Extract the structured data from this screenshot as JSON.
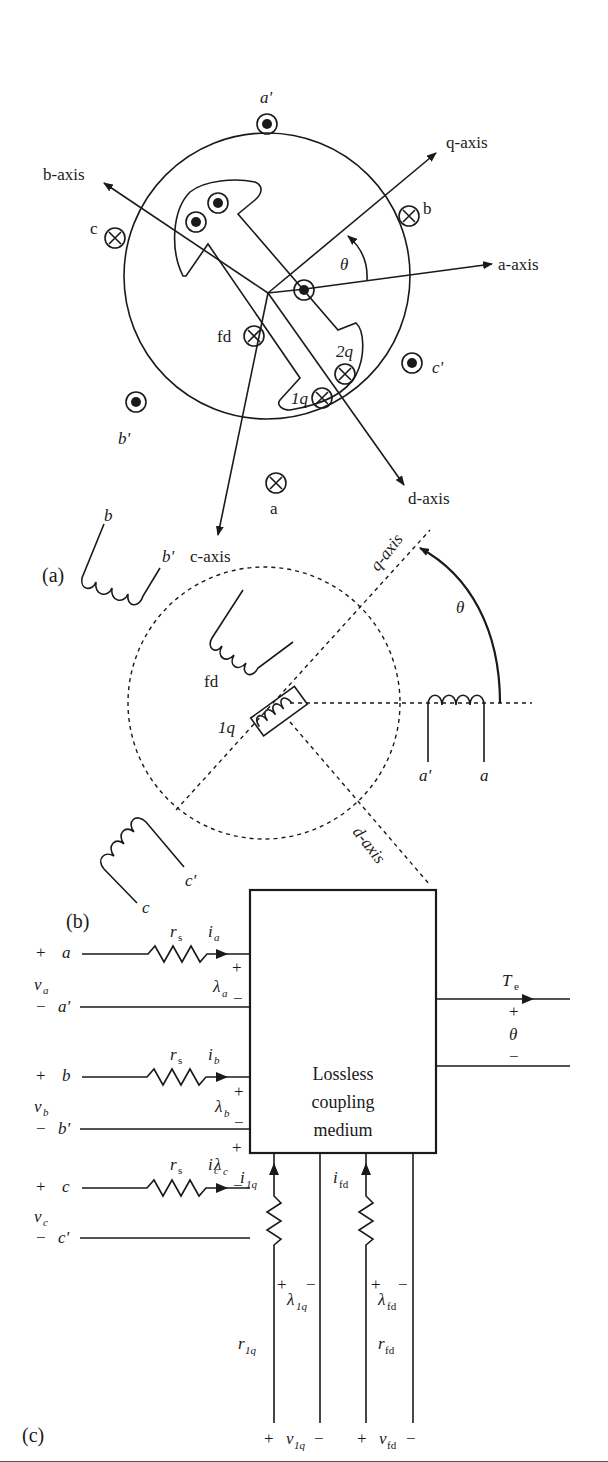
{
  "figure": {
    "panels": [
      {
        "id": "a",
        "caption": "(a)",
        "title": "Cross-section of synchronous machine with stator and rotor windings",
        "axes": [
          "a-axis",
          "b-axis",
          "c-axis",
          "d-axis",
          "q-axis"
        ],
        "stator_conductors": [
          {
            "label": "a'",
            "symbol": "dot"
          },
          {
            "label": "b",
            "symbol": "cross"
          },
          {
            "label": "c'",
            "symbol": "dot"
          },
          {
            "label": "a",
            "symbol": "cross"
          },
          {
            "label": "b'",
            "symbol": "dot"
          },
          {
            "label": "c",
            "symbol": "cross"
          }
        ],
        "rotor_conductors": [
          {
            "label": "fd",
            "symbol": "cross"
          },
          {
            "label": "2q",
            "symbol": "cross"
          },
          {
            "label": "1q",
            "symbol": "cross"
          }
        ],
        "angle_label": "θ"
      },
      {
        "id": "b",
        "caption": "(b)",
        "title": "Winding schematic",
        "axis_labels": [
          "q-axis",
          "d-axis"
        ],
        "windings": [
          {
            "label_start": "a'",
            "label_end": "a"
          },
          {
            "label_start": "b",
            "label_end": "b'"
          },
          {
            "label_start": "c'",
            "label_end": "c"
          },
          {
            "label": "fd"
          },
          {
            "label": "1q"
          }
        ],
        "angle_label": "θ"
      },
      {
        "id": "c",
        "caption": "(c)",
        "title": "Lossless coupling medium model",
        "box_label_lines": [
          "Lossless",
          "coupling",
          "medium"
        ],
        "stator_ports": [
          {
            "terminal": "a",
            "terminal_prime": "a'",
            "resistor": "r",
            "resistor_sub": "s",
            "current": "i",
            "current_sub": "a",
            "voltage": "v",
            "voltage_sub": "a",
            "flux": "λ",
            "flux_sub": "a"
          },
          {
            "terminal": "b",
            "terminal_prime": "b'",
            "resistor": "r",
            "resistor_sub": "s",
            "current": "i",
            "current_sub": "b",
            "voltage": "v",
            "voltage_sub": "b",
            "flux": "λ",
            "flux_sub": "b"
          },
          {
            "terminal": "c",
            "terminal_prime": "c'",
            "resistor": "r",
            "resistor_sub": "s",
            "current": "i",
            "current_sub": "c",
            "voltage": "v",
            "voltage_sub": "c",
            "flux": "λ",
            "flux_sub": "c"
          }
        ],
        "rotor_ports": [
          {
            "current": "i",
            "current_sub": "1q",
            "flux": "λ",
            "flux_sub": "1q",
            "resistor": "r",
            "resistor_sub": "1q",
            "voltage": "v",
            "voltage_sub": "1q"
          },
          {
            "current": "i",
            "current_sub": "fd",
            "flux": "λ",
            "flux_sub": "fd",
            "resistor": "r",
            "resistor_sub": "fd",
            "voltage": "v",
            "voltage_sub": "fd"
          }
        ],
        "mechanical_port": {
          "torque": "T",
          "torque_sub": "e",
          "angle": "θ"
        },
        "signs": {
          "plus": "+",
          "minus": "−"
        }
      }
    ]
  }
}
